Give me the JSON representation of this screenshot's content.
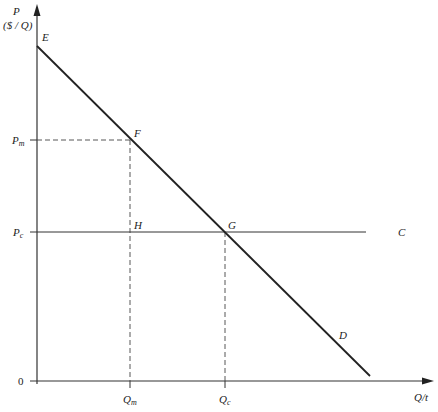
{
  "diagram": {
    "type": "monopoly-deadweight-loss",
    "y_axis": {
      "label_line1": "P",
      "label_line2": "($ / Q)"
    },
    "x_axis": {
      "label": "Q/t"
    },
    "origin_label": "0",
    "price_ticks": [
      {
        "base": "P",
        "sub": "m"
      },
      {
        "base": "P",
        "sub": "c"
      }
    ],
    "quantity_ticks": [
      {
        "base": "Q",
        "sub": "m"
      },
      {
        "base": "Q",
        "sub": "c"
      }
    ],
    "points": {
      "E": "E",
      "F": "F",
      "G": "G",
      "H": "H",
      "C": "C",
      "D": "D"
    },
    "lines": [
      {
        "name": "demand",
        "from": "E",
        "to": "D",
        "style": "solid-thick"
      },
      {
        "name": "marginal-cost",
        "from": "Pc",
        "to": "C",
        "style": "solid-thin"
      },
      {
        "name": "Pm-guide",
        "style": "dashed"
      },
      {
        "name": "Qm-guide",
        "style": "dashed"
      },
      {
        "name": "Qc-guide",
        "style": "dashed"
      }
    ],
    "colors": {
      "line": "#222222",
      "axis": "#333333",
      "background": "#ffffff"
    }
  }
}
